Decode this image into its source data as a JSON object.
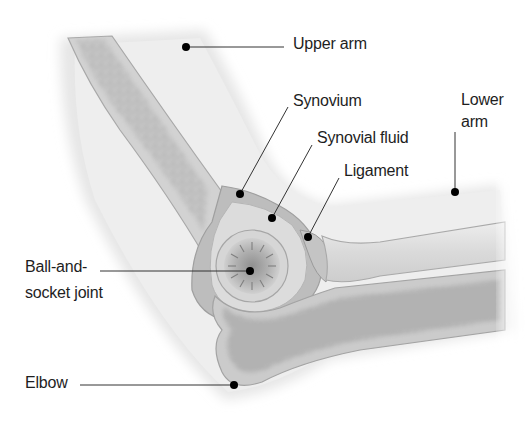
{
  "diagram": {
    "labels": {
      "upper_arm": "Upper arm",
      "synovium": "Synovium",
      "synovial_fluid": "Synovial fluid",
      "ligament": "Ligament",
      "lower_arm_line1": "Lower",
      "lower_arm_line2": "arm",
      "ball_socket_line1": "Ball-and-",
      "ball_socket_line2": "socket joint",
      "elbow": "Elbow"
    },
    "colors": {
      "background": "#ffffff",
      "skin_light": "#f2f2f2",
      "skin_mid": "#e2e2e2",
      "skin_dark": "#cfcfcf",
      "bone_fill": "#c9c9c9",
      "bone_marrow_spots": "#8d8d8d",
      "synovium": "#a9a9a9",
      "synovial_fluid": "#dcdcdc",
      "leader_line": "#333333",
      "leader_dot": "#000000",
      "text": "#1e1e1e"
    }
  }
}
